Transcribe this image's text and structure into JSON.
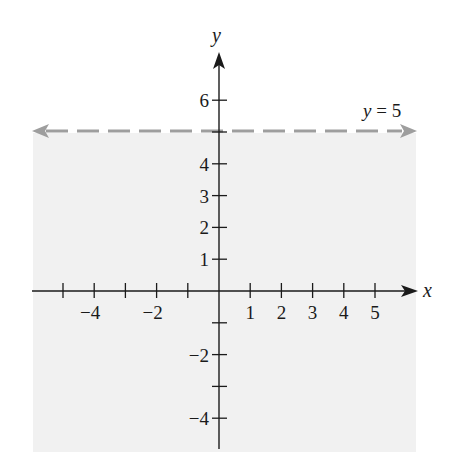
{
  "chart_data": {
    "type": "line",
    "title": "",
    "subtitle": "",
    "xlabel": "x",
    "ylabel": "y",
    "xlim": [
      -5.8,
      6.3
    ],
    "ylim": [
      -5.0,
      7.4
    ],
    "grid": false,
    "x_ticks": [
      -5,
      -4,
      -3,
      -2,
      -1,
      1,
      2,
      3,
      4,
      5
    ],
    "x_tick_labels": [
      {
        "value": -4,
        "label": "−4"
      },
      {
        "value": -2,
        "label": "−2"
      },
      {
        "value": 1,
        "label": "1"
      },
      {
        "value": 2,
        "label": "2"
      },
      {
        "value": 3,
        "label": "3"
      },
      {
        "value": 4,
        "label": "4"
      },
      {
        "value": 5,
        "label": "5"
      }
    ],
    "y_ticks": [
      -4,
      -3,
      -2,
      -1,
      1,
      2,
      3,
      4,
      5,
      6
    ],
    "y_tick_labels": [
      {
        "value": 6,
        "label": "6"
      },
      {
        "value": 4,
        "label": "4"
      },
      {
        "value": 3,
        "label": "3"
      },
      {
        "value": 2,
        "label": "2"
      },
      {
        "value": 1,
        "label": "1"
      },
      {
        "value": -2,
        "label": "−2"
      },
      {
        "value": -4,
        "label": "−4"
      }
    ],
    "series": [
      {
        "name": "y = 5",
        "kind": "boundary-line",
        "equation": "y = 5",
        "style": "dashed",
        "color": "#9e9e9e",
        "x": [
          -5.8,
          6.3
        ],
        "y": [
          5,
          5
        ],
        "arrows": "both"
      }
    ],
    "shaded_region": {
      "description": "half-plane below y = 5 (y < 5)",
      "inequality": "y < 5",
      "x_range": [
        -5.8,
        6.3
      ],
      "y_range": [
        -5.0,
        5
      ],
      "color": "#f1f1f1"
    },
    "annotations": [
      {
        "text": "y = 5",
        "x": 5.6,
        "y": 5.6
      }
    ],
    "legend": null
  },
  "labels": {
    "x_axis": "x",
    "y_axis": "y",
    "line_label_var": "y",
    "line_label_rest": " = 5"
  },
  "colors": {
    "axis": "#1a1a1a",
    "boundary_line": "#9e9e9e",
    "shading": "#f1f1f1",
    "background": "#ffffff"
  }
}
